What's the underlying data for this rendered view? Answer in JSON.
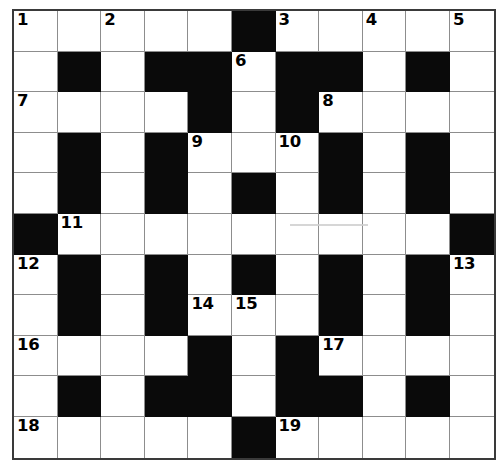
{
  "puzzle": {
    "type": "crossword-grid",
    "rows": 11,
    "cols": 11,
    "colors": {
      "block": "#0a0a0a",
      "cell": "#ffffff",
      "grid_line": "#8d8d8d",
      "border": "#3a3a3a",
      "number_text": "#000000"
    },
    "grid": [
      [
        "W",
        "W",
        "W",
        "W",
        "W",
        "B",
        "W",
        "W",
        "W",
        "W",
        "W"
      ],
      [
        "W",
        "B",
        "W",
        "B",
        "B",
        "W",
        "B",
        "B",
        "W",
        "B",
        "W"
      ],
      [
        "W",
        "W",
        "W",
        "W",
        "B",
        "W",
        "B",
        "W",
        "W",
        "W",
        "W"
      ],
      [
        "W",
        "B",
        "W",
        "B",
        "W",
        "W",
        "W",
        "B",
        "W",
        "B",
        "W"
      ],
      [
        "W",
        "B",
        "W",
        "B",
        "W",
        "B",
        "W",
        "B",
        "W",
        "B",
        "W"
      ],
      [
        "B",
        "W",
        "W",
        "W",
        "W",
        "W",
        "W",
        "W",
        "W",
        "W",
        "B"
      ],
      [
        "W",
        "B",
        "W",
        "B",
        "W",
        "B",
        "W",
        "B",
        "W",
        "B",
        "W"
      ],
      [
        "W",
        "B",
        "W",
        "B",
        "W",
        "W",
        "W",
        "B",
        "W",
        "B",
        "W"
      ],
      [
        "W",
        "W",
        "W",
        "W",
        "B",
        "W",
        "B",
        "W",
        "W",
        "W",
        "W"
      ],
      [
        "W",
        "B",
        "W",
        "B",
        "B",
        "W",
        "B",
        "B",
        "W",
        "B",
        "W"
      ],
      [
        "W",
        "W",
        "W",
        "W",
        "W",
        "B",
        "W",
        "W",
        "W",
        "W",
        "W"
      ]
    ],
    "numbers": [
      {
        "row": 0,
        "col": 0,
        "label": "1"
      },
      {
        "row": 0,
        "col": 2,
        "label": "2"
      },
      {
        "row": 0,
        "col": 6,
        "label": "3"
      },
      {
        "row": 0,
        "col": 8,
        "label": "4"
      },
      {
        "row": 0,
        "col": 10,
        "label": "5"
      },
      {
        "row": 1,
        "col": 5,
        "label": "6"
      },
      {
        "row": 2,
        "col": 0,
        "label": "7"
      },
      {
        "row": 2,
        "col": 7,
        "label": "8"
      },
      {
        "row": 3,
        "col": 4,
        "label": "9"
      },
      {
        "row": 3,
        "col": 6,
        "label": "10"
      },
      {
        "row": 5,
        "col": 1,
        "label": "11"
      },
      {
        "row": 6,
        "col": 0,
        "label": "12"
      },
      {
        "row": 6,
        "col": 10,
        "label": "13"
      },
      {
        "row": 7,
        "col": 4,
        "label": "14"
      },
      {
        "row": 7,
        "col": 5,
        "label": "15"
      },
      {
        "row": 8,
        "col": 0,
        "label": "16"
      },
      {
        "row": 8,
        "col": 7,
        "label": "17"
      },
      {
        "row": 10,
        "col": 0,
        "label": "18"
      },
      {
        "row": 10,
        "col": 6,
        "label": "19"
      }
    ]
  }
}
